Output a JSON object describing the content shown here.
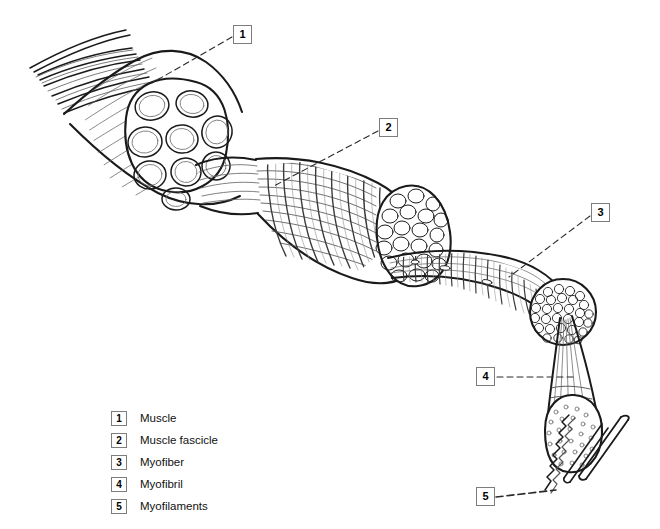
{
  "diagram": {
    "background_color": "#ffffff",
    "line_color": "#1a1a1a",
    "callout_border_color": "#7d7d7d",
    "callouts": [
      {
        "id": "1",
        "number": "1",
        "target": "whole-muscle-cross-section"
      },
      {
        "id": "2",
        "number": "2",
        "target": "muscle-fascicle"
      },
      {
        "id": "3",
        "number": "3",
        "target": "myofiber"
      },
      {
        "id": "4",
        "number": "4",
        "target": "myofibril"
      },
      {
        "id": "5",
        "number": "5",
        "target": "myofilaments"
      }
    ],
    "legend": {
      "items": [
        {
          "key": "1",
          "label": "Muscle"
        },
        {
          "key": "2",
          "label": "Muscle fascicle"
        },
        {
          "key": "3",
          "label": "Myofiber"
        },
        {
          "key": "4",
          "label": "Myofibril"
        },
        {
          "key": "5",
          "label": "Myofilaments"
        }
      ]
    },
    "structures": [
      {
        "name": "muscle",
        "description": "Whole muscle with splayed tendon fibers at upper left and a cut cross-section revealing nine fascicles"
      },
      {
        "name": "muscle-fascicle",
        "description": "Striated fascicle bundle with cross-section of many myofibers"
      },
      {
        "name": "myofiber",
        "description": "Long striated muscle cell ending in a cross-section of myofibrils"
      },
      {
        "name": "myofibril",
        "description": "Tapering myofibril with stippled cross-section"
      },
      {
        "name": "myofilaments",
        "description": "Thin wavy actin filament and thick myosin rod"
      }
    ]
  }
}
